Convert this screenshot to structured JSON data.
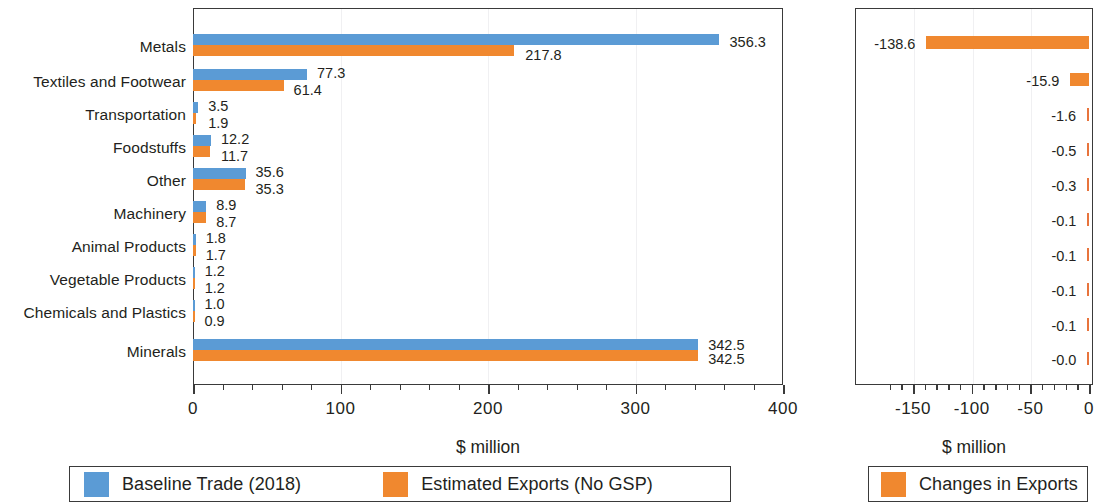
{
  "chart_data": [
    {
      "type": "bar",
      "orientation": "horizontal",
      "id": "baseline-vs-estimated-exports",
      "title": "",
      "xlabel": "$ million",
      "ylabel": "",
      "xlim": [
        0,
        400
      ],
      "xticks": [
        0,
        100,
        200,
        300,
        400
      ],
      "xtick_labels": [
        "0",
        "100",
        "200",
        "300",
        "400"
      ],
      "minor_tick_step": 20,
      "grid": "vertical-faint",
      "legend_position": "bottom",
      "categories": [
        "Metals",
        "Textiles and Footwear",
        "Transportation",
        "Foodstuffs",
        "Other",
        "Machinery",
        "Animal Products",
        "Vegetable Products",
        "Chemicals and Plastics",
        "Minerals"
      ],
      "series": [
        {
          "name": "Baseline Trade (2018)",
          "color": "#5b9bd5",
          "values": [
            356.3,
            77.3,
            3.5,
            12.2,
            35.6,
            8.9,
            1.8,
            1.2,
            1.0,
            342.5
          ],
          "labels": [
            "356.3",
            "77.3",
            "3.5",
            "12.2",
            "35.6",
            "8.9",
            "1.8",
            "1.2",
            "1.0",
            "342.5"
          ]
        },
        {
          "name": "Estimated Exports (No GSP)",
          "color": "#f0882f",
          "values": [
            217.8,
            61.4,
            1.9,
            11.7,
            35.3,
            8.7,
            1.7,
            1.2,
            0.9,
            342.5
          ],
          "labels": [
            "217.8",
            "61.4",
            "1.9",
            "11.7",
            "35.3",
            "8.7",
            "1.7",
            "1.2",
            "0.9",
            "342.5"
          ]
        }
      ]
    },
    {
      "type": "bar",
      "orientation": "horizontal",
      "id": "changes-in-exports",
      "title": "",
      "xlabel": "$ million",
      "ylabel": "",
      "xlim": [
        -175,
        0
      ],
      "xticks": [
        -150,
        -100,
        -50,
        0
      ],
      "xtick_labels": [
        "-150",
        "-100",
        "-50",
        "0"
      ],
      "minor_tick_step": 10,
      "grid": "vertical-faint",
      "legend_position": "bottom",
      "categories": [
        "Metals",
        "Textiles and Footwear",
        "Transportation",
        "Foodstuffs",
        "Other",
        "Machinery",
        "Animal Products",
        "Vegetable Products",
        "Chemicals and Plastics",
        "Minerals"
      ],
      "series": [
        {
          "name": "Changes in Exports",
          "color": "#f0882f",
          "values": [
            -138.6,
            -15.9,
            -1.6,
            -0.5,
            -0.3,
            -0.1,
            -0.1,
            -0.1,
            -0.1,
            -0.0
          ],
          "labels": [
            "-138.6",
            "-15.9",
            "-1.6",
            "-0.5",
            "-0.3",
            "-0.1",
            "-0.1",
            "-0.1",
            "-0.1",
            "-0.0"
          ]
        }
      ]
    }
  ],
  "left": {
    "axis_title": "$ million",
    "tick_labels": [
      "0",
      "100",
      "200",
      "300",
      "400"
    ],
    "categories": [
      "Metals",
      "Textiles and Footwear",
      "Transportation",
      "Foodstuffs",
      "Other",
      "Machinery",
      "Animal Products",
      "Vegetable Products",
      "Chemicals and Plastics",
      "Minerals"
    ],
    "blue_labels": [
      "356.3",
      "77.3",
      "3.5",
      "12.2",
      "35.6",
      "8.9",
      "1.8",
      "1.2",
      "1.0",
      "342.5"
    ],
    "orange_labels": [
      "217.8",
      "61.4",
      "1.9",
      "11.7",
      "35.3",
      "8.7",
      "1.7",
      "1.2",
      "0.9",
      "342.5"
    ],
    "legend": [
      {
        "label": "Baseline Trade (2018)",
        "color": "#5b9bd5"
      },
      {
        "label": "Estimated Exports (No GSP)",
        "color": "#f0882f"
      }
    ]
  },
  "right": {
    "axis_title": "$ million",
    "tick_labels": [
      "-150",
      "-100",
      "-50",
      "0"
    ],
    "value_labels": [
      "-138.6",
      "-15.9",
      "-1.6",
      "-0.5",
      "-0.3",
      "-0.1",
      "-0.1",
      "-0.1",
      "-0.1",
      "-0.0"
    ],
    "legend": [
      {
        "label": "Changes in Exports",
        "color": "#f0882f"
      }
    ]
  },
  "colors": {
    "blue": "#5b9bd5",
    "orange": "#f0882f",
    "axis": "#3a3a3a",
    "text": "#231f20",
    "grid": "#f0f0f2"
  }
}
